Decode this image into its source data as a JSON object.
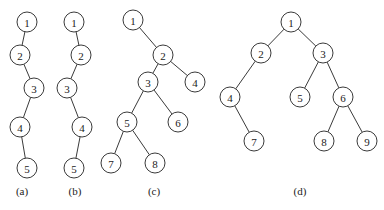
{
  "diagram": {
    "type": "binary-trees",
    "colors": {
      "stroke": "#3a3a3a",
      "fill": "#ffffff",
      "text": "#222222"
    },
    "node_radius": 10,
    "trees": [
      {
        "caption": "(a)",
        "caption_pos": [
          22,
          191
        ],
        "nodes": [
          {
            "id": "1",
            "x": 27,
            "y": 22
          },
          {
            "id": "2",
            "x": 20,
            "y": 55
          },
          {
            "id": "3",
            "x": 34,
            "y": 88
          },
          {
            "id": "4",
            "x": 20,
            "y": 127
          },
          {
            "id": "5",
            "x": 27,
            "y": 168
          }
        ],
        "edges": [
          [
            "1",
            "2"
          ],
          [
            "2",
            "3"
          ],
          [
            "3",
            "4"
          ],
          [
            "4",
            "5"
          ]
        ]
      },
      {
        "caption": "(b)",
        "caption_pos": [
          75,
          191
        ],
        "nodes": [
          {
            "id": "1",
            "x": 74,
            "y": 22
          },
          {
            "id": "2",
            "x": 81,
            "y": 55
          },
          {
            "id": "3",
            "x": 67,
            "y": 88
          },
          {
            "id": "4",
            "x": 82,
            "y": 127
          },
          {
            "id": "5",
            "x": 74,
            "y": 168
          }
        ],
        "edges": [
          [
            "1",
            "2"
          ],
          [
            "2",
            "3"
          ],
          [
            "3",
            "4"
          ],
          [
            "4",
            "5"
          ]
        ]
      },
      {
        "caption": "(c)",
        "caption_pos": [
          154,
          191
        ],
        "nodes": [
          {
            "id": "1",
            "x": 133,
            "y": 20
          },
          {
            "id": "2",
            "x": 163,
            "y": 55
          },
          {
            "id": "3",
            "x": 148,
            "y": 82
          },
          {
            "id": "4",
            "x": 195,
            "y": 82
          },
          {
            "id": "5",
            "x": 127,
            "y": 122
          },
          {
            "id": "6",
            "x": 178,
            "y": 122
          },
          {
            "id": "7",
            "x": 111,
            "y": 163
          },
          {
            "id": "8",
            "x": 155,
            "y": 163
          }
        ],
        "edges": [
          [
            "1",
            "2"
          ],
          [
            "2",
            "3"
          ],
          [
            "2",
            "4"
          ],
          [
            "3",
            "5"
          ],
          [
            "3",
            "6"
          ],
          [
            "5",
            "7"
          ],
          [
            "5",
            "8"
          ]
        ]
      },
      {
        "caption": "(d)",
        "caption_pos": [
          300,
          191
        ],
        "nodes": [
          {
            "id": "1",
            "x": 291,
            "y": 22
          },
          {
            "id": "2",
            "x": 261,
            "y": 53
          },
          {
            "id": "3",
            "x": 323,
            "y": 53
          },
          {
            "id": "4",
            "x": 230,
            "y": 97
          },
          {
            "id": "5",
            "x": 300,
            "y": 97
          },
          {
            "id": "6",
            "x": 343,
            "y": 97
          },
          {
            "id": "7",
            "x": 254,
            "y": 141
          },
          {
            "id": "8",
            "x": 324,
            "y": 141
          },
          {
            "id": "9",
            "x": 367,
            "y": 141
          }
        ],
        "edges": [
          [
            "1",
            "2"
          ],
          [
            "1",
            "3"
          ],
          [
            "2",
            "4"
          ],
          [
            "4",
            "7"
          ],
          [
            "3",
            "5"
          ],
          [
            "3",
            "6"
          ],
          [
            "6",
            "8"
          ],
          [
            "6",
            "9"
          ]
        ]
      }
    ]
  }
}
